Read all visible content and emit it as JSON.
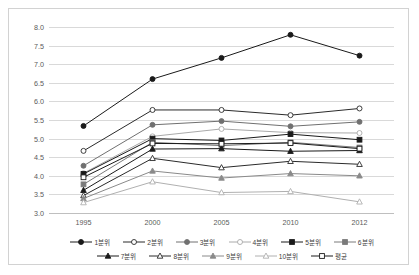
{
  "chart_data": {
    "type": "line",
    "title": "",
    "xlabel": "",
    "ylabel": "",
    "x": [
      "1995",
      "2000",
      "2005",
      "2010",
      "2012"
    ],
    "categories": [
      "1995",
      "2000",
      "2005",
      "2010",
      "2012"
    ],
    "ylim": [
      3.0,
      8.0
    ],
    "yticks": [
      "3.0",
      "3.5",
      "4.0",
      "4.5",
      "5.0",
      "5.5",
      "6.0",
      "6.5",
      "7.0",
      "7.5",
      "8.0"
    ],
    "ytick_values": [
      3.0,
      3.5,
      4.0,
      4.5,
      5.0,
      5.5,
      6.0,
      6.5,
      7.0,
      7.5,
      8.0
    ],
    "grid": true,
    "legend_position": "bottom",
    "series": [
      {
        "name": "1분위",
        "marker": "filled-circle",
        "color": "#1a1a1a",
        "values": [
          5.34,
          6.6,
          7.17,
          7.79,
          7.23
        ]
      },
      {
        "name": "2분위",
        "marker": "open-circle",
        "color": "#2b2b2b",
        "values": [
          4.67,
          5.77,
          5.77,
          5.63,
          5.81
        ]
      },
      {
        "name": "3분위",
        "marker": "filled-circle",
        "color": "#707070",
        "values": [
          4.27,
          5.37,
          5.47,
          5.33,
          5.45
        ]
      },
      {
        "name": "4분위",
        "marker": "open-circle",
        "color": "#aaaaaa",
        "values": [
          4.07,
          5.06,
          5.26,
          5.16,
          5.15
        ]
      },
      {
        "name": "5분위",
        "marker": "filled-square",
        "color": "#1a1a1a",
        "values": [
          4.05,
          5.0,
          4.95,
          5.12,
          4.97
        ]
      },
      {
        "name": "6분위",
        "marker": "filled-square",
        "color": "#7a7a7a",
        "values": [
          3.77,
          4.9,
          4.81,
          4.9,
          4.76
        ]
      },
      {
        "name": "7분위",
        "marker": "filled-triangle",
        "color": "#1a1a1a",
        "values": [
          3.61,
          4.72,
          4.73,
          4.66,
          4.68
        ]
      },
      {
        "name": "8분위",
        "marker": "open-triangle",
        "color": "#2b2b2b",
        "values": [
          3.47,
          4.47,
          4.22,
          4.39,
          4.31
        ]
      },
      {
        "name": "9분위",
        "marker": "filled-triangle",
        "color": "#8a8a8a",
        "values": [
          3.39,
          4.13,
          3.94,
          4.06,
          4.0
        ]
      },
      {
        "name": "10분위",
        "marker": "open-triangle",
        "color": "#b0b0b0",
        "values": [
          3.28,
          3.84,
          3.55,
          3.58,
          3.3
        ]
      },
      {
        "name": "평균",
        "marker": "open-square",
        "color": "#1a1a1a",
        "values": [
          3.96,
          4.87,
          4.86,
          4.88,
          4.73
        ]
      }
    ]
  }
}
